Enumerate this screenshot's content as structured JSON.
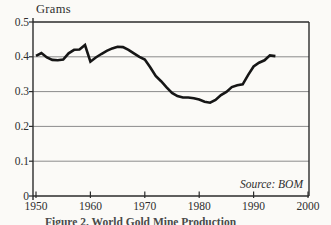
{
  "chart": {
    "y_axis_title": "Grams",
    "source": "Source: BOM",
    "caption_clipped": "Figure 2. World Gold Mine Production"
  },
  "chart_data": {
    "type": "line",
    "title": "Grams",
    "xlabel": "",
    "ylabel": "Grams",
    "xlim": [
      1950,
      2000
    ],
    "ylim": [
      0,
      0.5
    ],
    "x_ticks": [
      "1950",
      "1960",
      "1970",
      "1980",
      "1990",
      "2000"
    ],
    "y_ticks": [
      "0",
      "0.1",
      "0.2",
      "0.3",
      "0.4",
      "0.5"
    ],
    "grid": "horizontal",
    "legend": "none",
    "line_color": "#161616",
    "annotations": [
      "Source: BOM"
    ],
    "series": [
      {
        "name": "grams",
        "x": [
          1950,
          1951,
          1952,
          1953,
          1954,
          1955,
          1956,
          1957,
          1958,
          1959,
          1960,
          1961,
          1962,
          1963,
          1964,
          1965,
          1966,
          1967,
          1968,
          1969,
          1970,
          1971,
          1972,
          1973,
          1974,
          1975,
          1976,
          1977,
          1978,
          1979,
          1980,
          1981,
          1982,
          1983,
          1984,
          1985,
          1986,
          1987,
          1988,
          1989,
          1990,
          1991,
          1992,
          1993,
          1994
        ],
        "values": [
          0.403,
          0.411,
          0.398,
          0.391,
          0.39,
          0.392,
          0.41,
          0.42,
          0.421,
          0.434,
          0.386,
          0.398,
          0.408,
          0.417,
          0.424,
          0.429,
          0.428,
          0.42,
          0.41,
          0.4,
          0.392,
          0.37,
          0.345,
          0.33,
          0.312,
          0.296,
          0.287,
          0.283,
          0.283,
          0.281,
          0.277,
          0.271,
          0.268,
          0.276,
          0.29,
          0.299,
          0.313,
          0.318,
          0.321,
          0.348,
          0.372,
          0.383,
          0.39,
          0.404,
          0.402
        ]
      }
    ]
  }
}
